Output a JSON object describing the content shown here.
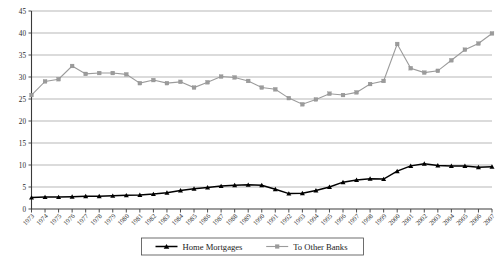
{
  "chart_data": {
    "type": "line",
    "title": "",
    "subtitle": "",
    "xlabel": "",
    "ylabel": "",
    "ylim": [
      0,
      45
    ],
    "ytick_step": 5,
    "yticks": [
      0,
      5,
      10,
      15,
      20,
      25,
      30,
      35,
      40,
      45
    ],
    "grid": true,
    "legend_position": "bottom",
    "x": [
      1973,
      1974,
      1975,
      1976,
      1977,
      1978,
      1979,
      1980,
      1981,
      1982,
      1983,
      1984,
      1985,
      1986,
      1987,
      1988,
      1989,
      1990,
      1991,
      1992,
      1993,
      1994,
      1995,
      1996,
      1997,
      1998,
      1999,
      2000,
      2001,
      2002,
      2003,
      2004,
      2005,
      2006,
      2007
    ],
    "categories": [
      "1973",
      "1974",
      "1975",
      "1976",
      "1977",
      "1978",
      "1979",
      "1980",
      "1981",
      "1982",
      "1983",
      "1984",
      "1985",
      "1986",
      "1987",
      "1988",
      "1989",
      "1990",
      "1991",
      "1992",
      "1993",
      "1994",
      "1995",
      "1996",
      "1997",
      "1998",
      "1999",
      "2000",
      "2001",
      "2002",
      "2003",
      "2004",
      "2005",
      "2006",
      "2007"
    ],
    "series": [
      {
        "name": "Home Mortgages",
        "color": "#000000",
        "marker": "triangle",
        "values": [
          2.6,
          2.7,
          2.7,
          2.8,
          2.9,
          2.9,
          3.0,
          3.1,
          3.2,
          3.4,
          3.7,
          4.2,
          4.6,
          4.9,
          5.2,
          5.4,
          5.5,
          5.4,
          4.5,
          3.5,
          3.6,
          4.2,
          5.0,
          6.1,
          6.6,
          6.9,
          6.8,
          8.6,
          9.8,
          10.3,
          9.9,
          9.8,
          9.8,
          9.5,
          9.6
        ]
      },
      {
        "name": "To Other Banks",
        "color": "#9b9b9b",
        "marker": "square",
        "values": [
          25.9,
          29.0,
          29.5,
          32.5,
          30.7,
          30.9,
          30.9,
          30.6,
          28.6,
          29.3,
          28.6,
          28.9,
          27.6,
          28.8,
          30.1,
          29.9,
          29.1,
          27.6,
          27.2,
          25.2,
          23.8,
          24.9,
          26.2,
          25.9,
          26.5,
          28.4,
          29.1,
          37.5,
          32.0,
          31.0,
          31.4,
          33.8,
          36.2,
          37.6,
          39.9
        ]
      }
    ]
  },
  "legend": {
    "entries": [
      {
        "label": "Home Mortgages",
        "color": "#000000"
      },
      {
        "label": "To Other Banks",
        "color": "#9b9b9b"
      }
    ]
  }
}
